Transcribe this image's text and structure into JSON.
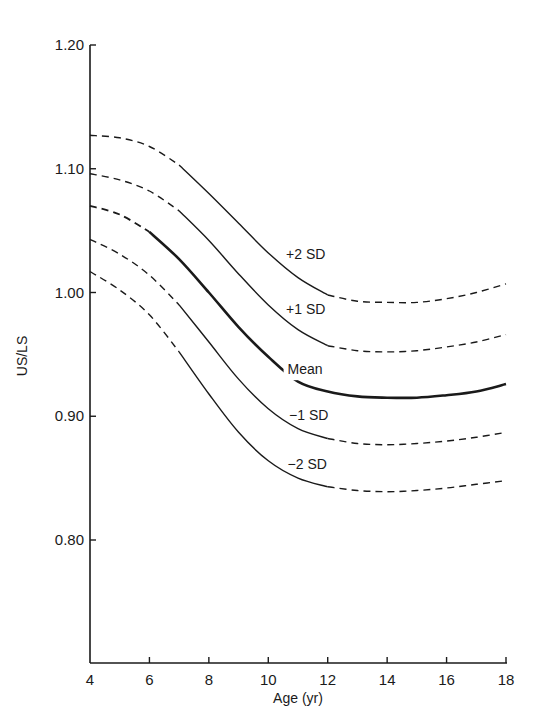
{
  "chart_data": {
    "type": "line",
    "title": "",
    "xlabel": "Age (yr)",
    "ylabel": "US/LS",
    "xlim": [
      4,
      18
    ],
    "ylim": [
      0.7,
      1.2
    ],
    "x_ticks": [
      4,
      6,
      8,
      10,
      12,
      14,
      16,
      18
    ],
    "x_tick_labels": [
      "4",
      "6",
      "8",
      "10",
      "12",
      "14",
      "16",
      "18"
    ],
    "y_ticks": [
      0.8,
      0.9,
      1.0,
      1.1,
      1.2
    ],
    "y_tick_labels": [
      "0.80",
      "0.90",
      "1.00",
      "1.10",
      "1.20"
    ],
    "grid": false,
    "legend": "inline labels",
    "x": [
      4,
      5,
      6,
      7,
      8,
      9,
      10,
      11,
      12,
      13,
      14,
      15,
      16,
      17,
      18
    ],
    "series": [
      {
        "name": "+2 SD",
        "label": "+2 SD",
        "values": [
          1.127,
          1.125,
          1.118,
          1.103,
          1.08,
          1.056,
          1.032,
          1.012,
          0.998,
          0.993,
          0.992,
          0.992,
          0.995,
          1.0,
          1.007
        ],
        "solid_range": [
          7,
          12
        ],
        "bold": false
      },
      {
        "name": "+1 SD",
        "label": "+1 SD",
        "values": [
          1.096,
          1.091,
          1.082,
          1.066,
          1.042,
          1.015,
          0.99,
          0.97,
          0.957,
          0.953,
          0.952,
          0.953,
          0.956,
          0.96,
          0.966
        ],
        "solid_range": [
          7,
          12
        ],
        "bold": false
      },
      {
        "name": "Mean",
        "label": "Mean",
        "values": [
          1.07,
          1.063,
          1.049,
          1.027,
          1.0,
          0.972,
          0.948,
          0.928,
          0.92,
          0.916,
          0.915,
          0.915,
          0.917,
          0.92,
          0.926
        ],
        "solid_range": [
          6,
          18
        ],
        "bold": true
      },
      {
        "name": "-1 SD",
        "label": "−1 SD",
        "values": [
          1.043,
          1.031,
          1.014,
          0.99,
          0.96,
          0.93,
          0.906,
          0.89,
          0.882,
          0.878,
          0.877,
          0.878,
          0.88,
          0.883,
          0.887
        ],
        "solid_range": [
          7,
          12
        ],
        "bold": false
      },
      {
        "name": "-2 SD",
        "label": "−2 SD",
        "values": [
          1.017,
          1.002,
          0.982,
          0.952,
          0.918,
          0.887,
          0.864,
          0.85,
          0.843,
          0.84,
          0.839,
          0.84,
          0.842,
          0.845,
          0.848
        ],
        "solid_range": [
          7,
          12
        ],
        "bold": false
      }
    ],
    "annotations": [
      {
        "text": "+2 SD",
        "x": 10.6,
        "y": 1.027
      },
      {
        "text": "+1 SD",
        "x": 10.6,
        "y": 0.983
      },
      {
        "text": "Mean",
        "x": 10.65,
        "y": 0.934
      },
      {
        "text": "−1 SD",
        "x": 10.7,
        "y": 0.897
      },
      {
        "text": "−2 SD",
        "x": 10.65,
        "y": 0.857
      }
    ]
  },
  "colors": {
    "background": "#ffffff",
    "ink": "#1a1a1a"
  }
}
